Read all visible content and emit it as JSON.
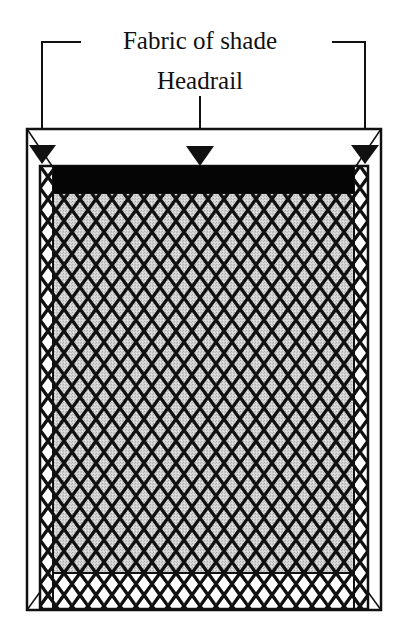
{
  "diagram": {
    "labels": {
      "fabric": "Fabric of shade",
      "headrail": "Headrail"
    },
    "colors": {
      "background": "#ffffff",
      "line": "#111111",
      "headrail": "#050505",
      "fabric_fill": "#c8c8c8"
    },
    "parts": [
      "outer-frame",
      "inner-frame",
      "headrail",
      "shade-fabric",
      "mesh-net"
    ]
  }
}
